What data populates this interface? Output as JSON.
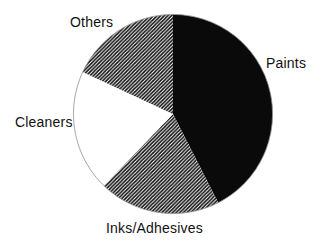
{
  "figure": {
    "background": "#ffffff"
  },
  "chart_data": {
    "type": "pie",
    "title": "",
    "legend": "none",
    "labels_placement": "outside",
    "categories": [
      "Paints",
      "Inks/Adhesives",
      "Cleaners",
      "Others"
    ],
    "values": [
      42.5,
      19.7,
      19.7,
      18.1
    ],
    "segments": [
      {
        "label": "Paints",
        "percent": 42.5,
        "start_angle": 0,
        "end_angle": 153,
        "fill": "solid-black"
      },
      {
        "label": "Inks/Adhesives",
        "percent": 19.7,
        "start_angle": 153,
        "end_angle": 224,
        "fill": "diagonal-hatch"
      },
      {
        "label": "Cleaners",
        "percent": 19.7,
        "start_angle": 224,
        "end_angle": 295,
        "fill": "white"
      },
      {
        "label": "Others",
        "percent": 18.1,
        "start_angle": 295,
        "end_angle": 360,
        "fill": "diagonal-hatch"
      }
    ],
    "colors": {
      "black": "#0a0a0a",
      "white": "#ffffff",
      "outline": "#929292",
      "hatch_stroke": "#0a0a0a"
    }
  }
}
